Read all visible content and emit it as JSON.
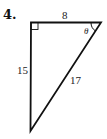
{
  "problem": {
    "number": "4.",
    "figure": "right-triangle",
    "sides": {
      "top": "8",
      "left": "15",
      "hypotenuse": "17"
    },
    "angle_label": "θ",
    "right_angle_marker": "top-left"
  }
}
